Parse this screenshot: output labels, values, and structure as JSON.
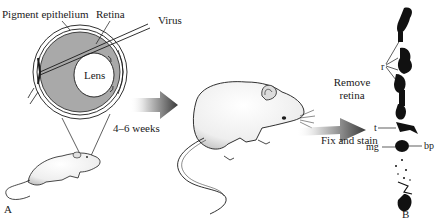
{
  "figure": {
    "panels": [
      {
        "id": "A",
        "label": "A"
      },
      {
        "id": "B",
        "label": "B"
      }
    ],
    "eye_diagram": {
      "labels": {
        "pigment_epithelium": "Pigment epithelium",
        "retina": "Retina",
        "virus": "Virus",
        "lens": "Lens"
      }
    },
    "steps": {
      "incubation": "4–6 weeks",
      "remove_retina_line1": "Remove",
      "remove_retina_line2": "retina",
      "fix_and_stain": "Fix and stain"
    },
    "cell_labels": {
      "r": "r",
      "t": "t",
      "mg": "mg",
      "bp": "bp"
    },
    "colors": {
      "ink": "#1a1a1a",
      "eye_fill": "#a9a9a9",
      "arrow_dark": "#3a3a3a",
      "arrow_light": "#d8d8d8",
      "mouse_fill": "#f4f4f4"
    }
  }
}
